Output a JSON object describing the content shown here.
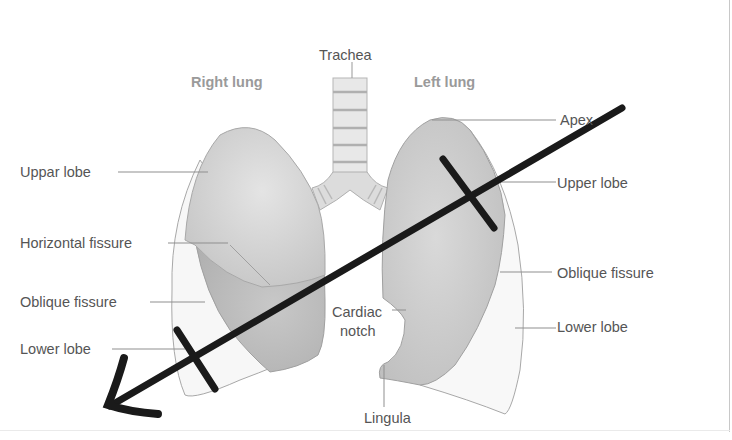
{
  "diagram": {
    "labels": {
      "trachea": "Trachea",
      "right_lung": "Right lung",
      "left_lung": "Left lung",
      "right_upper_lobe": "Uppar lobe",
      "horizontal_fissure": "Horizontal fissure",
      "right_oblique_fissure": "Oblique fissure",
      "right_lower_lobe": "Lower lobe",
      "apex": "Apex",
      "left_upper_lobe": "Upper lobe",
      "left_oblique_fissure": "Oblique fissure",
      "left_lower_lobe": "Lower lobe",
      "cardiac_notch_line1": "Cardiac",
      "cardiac_notch_line2": "notch",
      "lingula": "Lingula"
    },
    "annotation": {
      "type": "hand-drawn arrow",
      "direction": "upper-right to lower-left",
      "tick_marks": 2,
      "color": "#1a1a1a"
    },
    "colors": {
      "lobe_upper": "#d2d2d2",
      "lobe_lower_right_mid": "#bdbdbd",
      "lobe_lower": "#f7f7f7",
      "outline": "#a8a8a8",
      "label_text": "#555555",
      "heading_text": "#9a9a9a"
    }
  }
}
